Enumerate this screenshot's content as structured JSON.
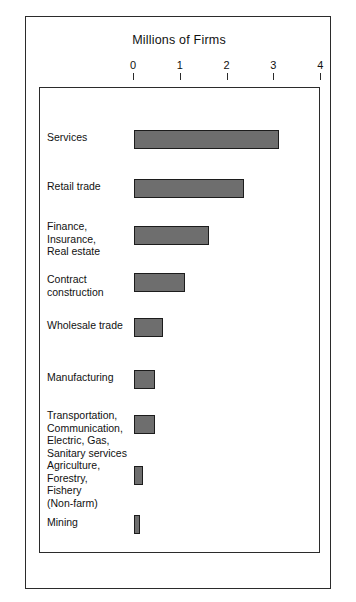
{
  "figure": {
    "title": "Millions of Firms"
  },
  "chart_data": {
    "type": "bar",
    "orientation": "horizontal",
    "title": "Millions of Firms",
    "xlabel": "Millions of Firms",
    "ylabel": "",
    "xlim": [
      0,
      4
    ],
    "xticks": [
      "0",
      "1",
      "2",
      "3",
      "4"
    ],
    "xtick_values": [
      0,
      1,
      2,
      3,
      4
    ],
    "grid": false,
    "legend": false,
    "bar_color": "#6e6e6e",
    "bar_edge_color": "#1c1c1c",
    "categories": [
      "Services",
      "Retail trade",
      "Finance,\nInsurance,\nReal estate",
      "Contract\nconstruction",
      "Wholesale trade",
      "Manufacturing",
      "Transportation,\nCommunication,\nElectric, Gas,\nSanitary services",
      "Agriculture,\nForestry,\nFishery\n(Non-farm)",
      "Mining"
    ],
    "values": [
      3.1,
      2.35,
      1.6,
      1.1,
      0.63,
      0.45,
      0.45,
      0.19,
      0.13
    ]
  }
}
